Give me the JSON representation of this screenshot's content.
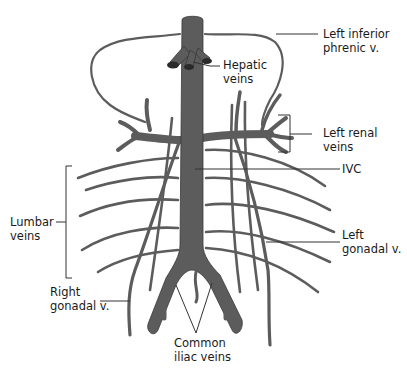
{
  "diagram": {
    "labels": {
      "left_inferior_phrenic": [
        "Left inferior",
        "phrenic v."
      ],
      "hepatic_veins": [
        "Hepatic",
        "veins"
      ],
      "left_renal_veins": [
        "Left renal",
        "veins"
      ],
      "ivc": [
        "IVC"
      ],
      "lumbar_veins": [
        "Lumbar",
        "veins"
      ],
      "left_gonadal": [
        "Left",
        "gonadal v."
      ],
      "right_gonadal": [
        "Right",
        "gonadal v."
      ],
      "common_iliac_veins": [
        "Common",
        "iliac veins"
      ]
    },
    "colors": {
      "vein": "#5c5c5c",
      "outline": "#3a3a3a",
      "text": "#1a1a1a",
      "background": "#ffffff"
    }
  }
}
